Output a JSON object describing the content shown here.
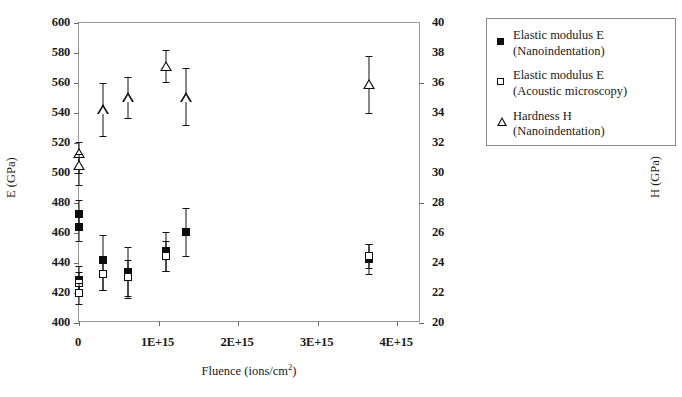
{
  "chart_data": {
    "type": "scatter",
    "title": "",
    "xlabel": "Fluence (ions/cm2)",
    "xlabel_base": "Fluence (ions/cm",
    "xlabel_sup": "2",
    "xlabel_tail": ")",
    "ylabel_left": "E (GPa)",
    "ylabel_right": "H (GPa)",
    "xlim": [
      0,
      4300000000000000.0
    ],
    "xticks": [
      0,
      1000000000000000.0,
      2000000000000000.0,
      3000000000000000.0,
      4000000000000000.0
    ],
    "xticklabels": [
      "0",
      "1E+15",
      "2E+15",
      "3E+15",
      "4E+15"
    ],
    "ylim_left": [
      400,
      600
    ],
    "yticks_left": [
      400,
      420,
      440,
      460,
      480,
      500,
      520,
      540,
      560,
      580,
      600
    ],
    "yticklabels_left": [
      "400",
      "420",
      "440",
      "460",
      "480",
      "500",
      "520",
      "540",
      "560",
      "580",
      "600"
    ],
    "ylim_right": [
      20,
      40
    ],
    "yticks_right": [
      20,
      22,
      24,
      26,
      28,
      30,
      32,
      34,
      36,
      38,
      40
    ],
    "yticklabels_right": [
      "20",
      "22",
      "24",
      "26",
      "28",
      "30",
      "32",
      "34",
      "36",
      "38",
      "40"
    ],
    "grid": false,
    "legend_position": "outside right top",
    "series": [
      {
        "name": "Elastic modulus E (Nanoindentation)",
        "marker": "filled-square",
        "axis": "left",
        "points": [
          {
            "x": 0.0,
            "y": 473,
            "yerr_low": 9,
            "yerr_high": 9
          },
          {
            "x": 0.0,
            "y": 464,
            "yerr_low": 9,
            "yerr_high": 9
          },
          {
            "x": 0.0,
            "y": 429,
            "yerr_low": 9,
            "yerr_high": 9
          },
          {
            "x": 300000000000000.0,
            "y": 442,
            "yerr_low": 20,
            "yerr_high": 17
          },
          {
            "x": 620000000000000.0,
            "y": 434,
            "yerr_low": 17,
            "yerr_high": 17
          },
          {
            "x": 1100000000000000.0,
            "y": 448,
            "yerr_low": 13,
            "yerr_high": 13
          },
          {
            "x": 1350000000000000.0,
            "y": 461,
            "yerr_low": 16,
            "yerr_high": 16
          },
          {
            "x": 3650000000000000.0,
            "y": 443,
            "yerr_low": 10,
            "yerr_high": 10
          }
        ]
      },
      {
        "name": "Elastic modulus E (Acoustic microscopy)",
        "marker": "open-square",
        "axis": "left",
        "points": [
          {
            "x": 0.0,
            "y": 427,
            "yerr_low": 7,
            "yerr_high": 7
          },
          {
            "x": 0.0,
            "y": 420,
            "yerr_low": 7,
            "yerr_high": 7
          },
          {
            "x": 300000000000000.0,
            "y": 433,
            "yerr_low": 11,
            "yerr_high": 11
          },
          {
            "x": 620000000000000.0,
            "y": 431,
            "yerr_low": 13,
            "yerr_high": 11
          },
          {
            "x": 1100000000000000.0,
            "y": 445,
            "yerr_low": 10,
            "yerr_high": 10
          },
          {
            "x": 3650000000000000.0,
            "y": 445,
            "yerr_low": 8,
            "yerr_high": 8
          }
        ]
      },
      {
        "name": "Hardness H (Nanoindentation)",
        "marker": "open-triangle",
        "axis": "right",
        "points": [
          {
            "x": 0.0,
            "y": 31.3,
            "yerr_low": 1.3,
            "yerr_high": 0.8
          },
          {
            "x": 0.0,
            "y": 30.5,
            "yerr_low": 1.3,
            "yerr_high": 0.8
          },
          {
            "x": 300000000000000.0,
            "y": 34.2,
            "yerr_low": 1.7,
            "yerr_high": 1.8
          },
          {
            "x": 620000000000000.0,
            "y": 35.0,
            "yerr_low": 1.3,
            "yerr_high": 1.4
          },
          {
            "x": 1100000000000000.0,
            "y": 37.1,
            "yerr_low": 1.0,
            "yerr_high": 1.1
          },
          {
            "x": 1350000000000000.0,
            "y": 35.0,
            "yerr_low": 1.8,
            "yerr_high": 2.0
          },
          {
            "x": 3650000000000000.0,
            "y": 35.9,
            "yerr_low": 1.9,
            "yerr_high": 1.9
          }
        ]
      }
    ],
    "legend": [
      {
        "key": "filled-square",
        "line1": "Elastic modulus E",
        "line2": "(Nanoindentation)"
      },
      {
        "key": "open-square",
        "line1": "Elastic modulus E",
        "line2": "(Acoustic microscopy)"
      },
      {
        "key": "open-triangle",
        "line1": "Hardness H",
        "line2": "(Nanoindentation)"
      }
    ],
    "colors": {
      "marker": "#0d0d0d",
      "frame": "#9a9a9a",
      "text": "#1a1a1a"
    }
  }
}
